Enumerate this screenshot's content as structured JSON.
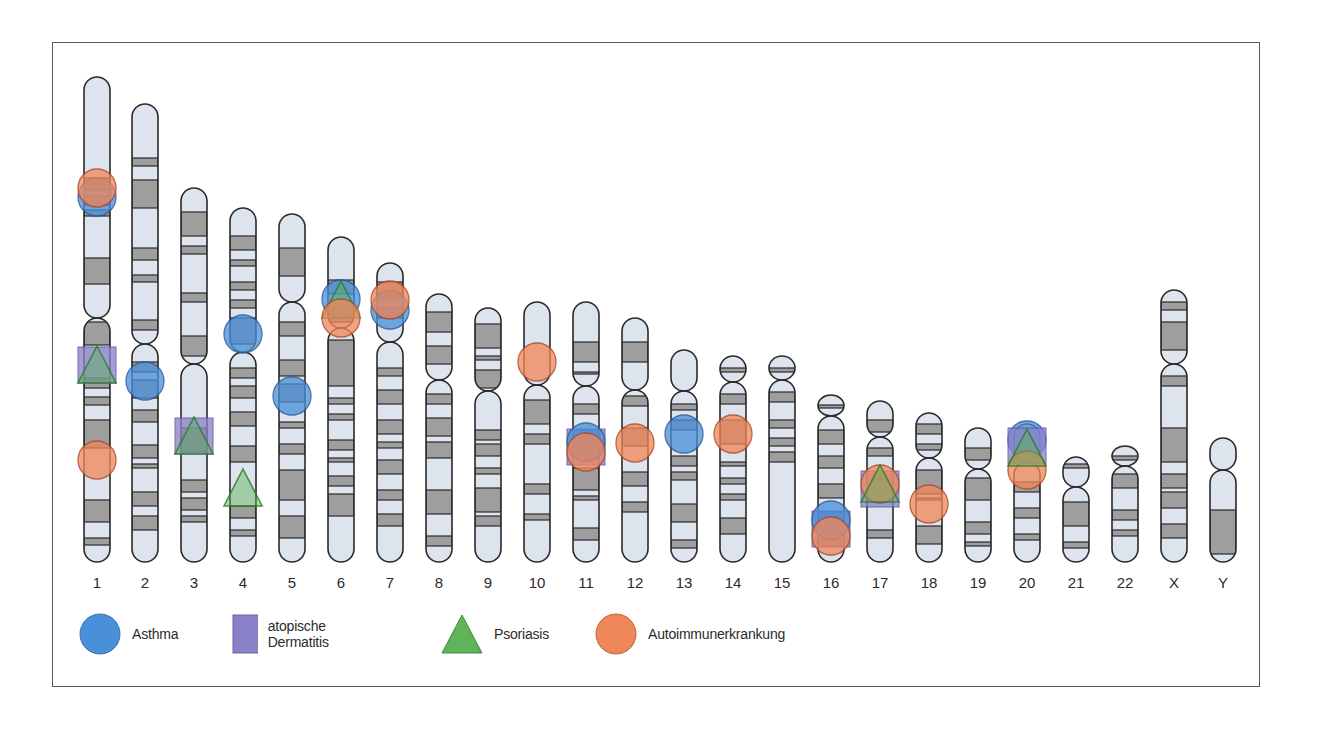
{
  "figure": {
    "colors": {
      "chromosome_fill": "#dde4ee",
      "band_fill": "#9e9e9e",
      "outline": "#2a2a2a",
      "asthma": "#4a90d9",
      "dermatitis": "#8a82c8",
      "psoriasis": "#5fb35a",
      "autoimmune": "#f0875a",
      "frame": "#5a5a5a"
    },
    "chromosomes": [
      {
        "label": "1",
        "x": 97,
        "top": 77,
        "cen": 318,
        "bottom": 562,
        "bands": [
          [
            178,
            190
          ],
          [
            196,
            205
          ],
          [
            210,
            216
          ],
          [
            258,
            284
          ],
          [
            322,
            345
          ],
          [
            378,
            388
          ],
          [
            397,
            405
          ],
          [
            420,
            448
          ],
          [
            500,
            522
          ],
          [
            538,
            545
          ]
        ]
      },
      {
        "label": "2",
        "x": 145,
        "top": 104,
        "cen": 344,
        "bottom": 562,
        "bands": [
          [
            158,
            166
          ],
          [
            180,
            208
          ],
          [
            248,
            260
          ],
          [
            275,
            282
          ],
          [
            320,
            330
          ],
          [
            362,
            372
          ],
          [
            380,
            398
          ],
          [
            410,
            422
          ],
          [
            445,
            458
          ],
          [
            464,
            468
          ],
          [
            492,
            506
          ],
          [
            516,
            530
          ]
        ]
      },
      {
        "label": "3",
        "x": 194,
        "top": 188,
        "cen": 364,
        "bottom": 562,
        "bands": [
          [
            212,
            236
          ],
          [
            246,
            254
          ],
          [
            293,
            302
          ],
          [
            336,
            356
          ],
          [
            428,
            452
          ],
          [
            480,
            492
          ],
          [
            498,
            510
          ],
          [
            516,
            522
          ]
        ]
      },
      {
        "label": "4",
        "x": 243,
        "top": 208,
        "cen": 352,
        "bottom": 562,
        "bands": [
          [
            236,
            250
          ],
          [
            260,
            266
          ],
          [
            282,
            290
          ],
          [
            300,
            308
          ],
          [
            318,
            344
          ],
          [
            368,
            378
          ],
          [
            386,
            398
          ],
          [
            412,
            426
          ],
          [
            446,
            462
          ],
          [
            506,
            518
          ],
          [
            530,
            536
          ]
        ]
      },
      {
        "label": "5",
        "x": 292,
        "top": 214,
        "cen": 302,
        "bottom": 562,
        "bands": [
          [
            248,
            276
          ],
          [
            322,
            336
          ],
          [
            360,
            376
          ],
          [
            384,
            402
          ],
          [
            422,
            428
          ],
          [
            444,
            454
          ],
          [
            470,
            500
          ],
          [
            516,
            538
          ]
        ]
      },
      {
        "label": "6",
        "x": 341,
        "top": 237,
        "cen": 328,
        "bottom": 562,
        "bands": [
          [
            280,
            294
          ],
          [
            308,
            322
          ],
          [
            340,
            386
          ],
          [
            398,
            404
          ],
          [
            414,
            420
          ],
          [
            440,
            450
          ],
          [
            458,
            462
          ],
          [
            476,
            486
          ],
          [
            494,
            516
          ]
        ]
      },
      {
        "label": "7",
        "x": 390,
        "top": 263,
        "cen": 342,
        "bottom": 562,
        "bands": [
          [
            282,
            298
          ],
          [
            308,
            318
          ],
          [
            368,
            376
          ],
          [
            390,
            404
          ],
          [
            420,
            434
          ],
          [
            442,
            448
          ],
          [
            460,
            474
          ],
          [
            490,
            500
          ],
          [
            514,
            526
          ]
        ]
      },
      {
        "label": "8",
        "x": 439,
        "top": 294,
        "cen": 380,
        "bottom": 562,
        "bands": [
          [
            312,
            332
          ],
          [
            346,
            364
          ],
          [
            394,
            404
          ],
          [
            418,
            436
          ],
          [
            442,
            458
          ],
          [
            490,
            514
          ],
          [
            536,
            546
          ]
        ]
      },
      {
        "label": "9",
        "x": 488,
        "top": 308,
        "cen": 391,
        "bottom": 562,
        "bands": [
          [
            324,
            348
          ],
          [
            356,
            360
          ],
          [
            370,
            388
          ],
          [
            430,
            440
          ],
          [
            444,
            456
          ],
          [
            468,
            474
          ],
          [
            488,
            512
          ],
          [
            516,
            526
          ]
        ]
      },
      {
        "label": "10",
        "x": 537,
        "top": 302,
        "cen": 385,
        "bottom": 562,
        "bands": [
          [
            400,
            424
          ],
          [
            434,
            444
          ],
          [
            484,
            494
          ],
          [
            514,
            520
          ]
        ]
      },
      {
        "label": "11",
        "x": 586,
        "top": 302,
        "cen": 386,
        "bottom": 562,
        "bands": [
          [
            342,
            362
          ],
          [
            372,
            374
          ],
          [
            404,
            414
          ],
          [
            430,
            446
          ],
          [
            468,
            490
          ],
          [
            496,
            500
          ],
          [
            528,
            540
          ]
        ]
      },
      {
        "label": "12",
        "x": 635,
        "top": 318,
        "cen": 390,
        "bottom": 562,
        "bands": [
          [
            342,
            362
          ],
          [
            396,
            406
          ],
          [
            428,
            446
          ],
          [
            472,
            486
          ],
          [
            502,
            512
          ]
        ]
      },
      {
        "label": "13",
        "x": 684,
        "top": 350,
        "cen": 391,
        "bottom": 562,
        "bands": [
          [
            404,
            410
          ],
          [
            420,
            430
          ],
          [
            456,
            466
          ],
          [
            472,
            480
          ],
          [
            504,
            522
          ],
          [
            540,
            548
          ]
        ]
      },
      {
        "label": "14",
        "x": 733,
        "top": 356,
        "cen": 382,
        "bottom": 562,
        "bands": [
          [
            368,
            372
          ],
          [
            394,
            404
          ],
          [
            420,
            444
          ],
          [
            462,
            466
          ],
          [
            478,
            484
          ],
          [
            494,
            500
          ],
          [
            518,
            534
          ]
        ]
      },
      {
        "label": "15",
        "x": 782,
        "top": 356,
        "cen": 380,
        "bottom": 562,
        "bands": [
          [
            368,
            372
          ],
          [
            392,
            402
          ],
          [
            420,
            428
          ],
          [
            438,
            446
          ],
          [
            452,
            462
          ]
        ]
      },
      {
        "label": "16",
        "x": 831,
        "top": 395,
        "cen": 416,
        "bottom": 562,
        "bands": [
          [
            405,
            408
          ],
          [
            430,
            444
          ],
          [
            456,
            468
          ],
          [
            484,
            498
          ],
          [
            512,
            518
          ],
          [
            528,
            532
          ],
          [
            540,
            546
          ]
        ]
      },
      {
        "label": "17",
        "x": 880,
        "top": 401,
        "cen": 437,
        "bottom": 562,
        "bands": [
          [
            420,
            432
          ],
          [
            448,
            456
          ],
          [
            530,
            538
          ]
        ]
      },
      {
        "label": "18",
        "x": 929,
        "top": 413,
        "cen": 458,
        "bottom": 562,
        "bands": [
          [
            424,
            434
          ],
          [
            444,
            450
          ],
          [
            470,
            494
          ],
          [
            498,
            500
          ],
          [
            526,
            544
          ]
        ]
      },
      {
        "label": "19",
        "x": 978,
        "top": 428,
        "cen": 469,
        "bottom": 562,
        "bands": [
          [
            448,
            460
          ],
          [
            478,
            500
          ],
          [
            522,
            534
          ],
          [
            542,
            546
          ]
        ]
      },
      {
        "label": "20",
        "x": 1027,
        "top": 424,
        "cen": 462,
        "bottom": 562,
        "bands": [
          [
            482,
            492
          ],
          [
            508,
            518
          ],
          [
            534,
            540
          ]
        ]
      },
      {
        "label": "21",
        "x": 1076,
        "top": 457,
        "cen": 487,
        "bottom": 562,
        "bands": [
          [
            464,
            468
          ],
          [
            502,
            526
          ],
          [
            542,
            548
          ]
        ]
      },
      {
        "label": "22",
        "x": 1125,
        "top": 446,
        "cen": 466,
        "bottom": 562,
        "bands": [
          [
            456,
            460
          ],
          [
            474,
            488
          ],
          [
            510,
            520
          ],
          [
            530,
            536
          ]
        ]
      },
      {
        "label": "X",
        "x": 1174,
        "top": 290,
        "cen": 364,
        "bottom": 562,
        "bands": [
          [
            302,
            310
          ],
          [
            322,
            350
          ],
          [
            376,
            386
          ],
          [
            428,
            462
          ],
          [
            474,
            488
          ],
          [
            492,
            508
          ],
          [
            524,
            538
          ]
        ]
      },
      {
        "label": "Y",
        "x": 1223,
        "top": 438,
        "cen": 470,
        "bottom": 562,
        "bands": [
          [
            510,
            554
          ]
        ]
      }
    ],
    "markers": [
      {
        "chr": 0,
        "type": "asthma",
        "y": 197
      },
      {
        "chr": 0,
        "type": "autoimmune",
        "y": 188
      },
      {
        "chr": 0,
        "type": "dermatitis",
        "y": 365
      },
      {
        "chr": 0,
        "type": "psoriasis",
        "y": 365
      },
      {
        "chr": 0,
        "type": "autoimmune",
        "y": 460
      },
      {
        "chr": 1,
        "type": "asthma",
        "y": 381
      },
      {
        "chr": 2,
        "type": "dermatitis",
        "y": 436
      },
      {
        "chr": 2,
        "type": "psoriasis",
        "y": 436
      },
      {
        "chr": 3,
        "type": "asthma",
        "y": 334
      },
      {
        "chr": 3,
        "type": "psoriasis",
        "y": 488
      },
      {
        "chr": 4,
        "type": "asthma",
        "y": 396
      },
      {
        "chr": 5,
        "type": "asthma",
        "y": 299
      },
      {
        "chr": 5,
        "type": "psoriasis",
        "y": 300
      },
      {
        "chr": 5,
        "type": "autoimmune",
        "y": 318
      },
      {
        "chr": 6,
        "type": "asthma",
        "y": 310
      },
      {
        "chr": 6,
        "type": "autoimmune",
        "y": 300
      },
      {
        "chr": 9,
        "type": "autoimmune",
        "y": 362
      },
      {
        "chr": 10,
        "type": "dermatitis",
        "y": 447
      },
      {
        "chr": 10,
        "type": "asthma",
        "y": 442
      },
      {
        "chr": 10,
        "type": "autoimmune",
        "y": 452
      },
      {
        "chr": 11,
        "type": "autoimmune",
        "y": 443
      },
      {
        "chr": 12,
        "type": "asthma",
        "y": 434
      },
      {
        "chr": 13,
        "type": "autoimmune",
        "y": 434
      },
      {
        "chr": 15,
        "type": "dermatitis",
        "y": 529
      },
      {
        "chr": 15,
        "type": "asthma",
        "y": 520
      },
      {
        "chr": 15,
        "type": "autoimmune",
        "y": 536
      },
      {
        "chr": 16,
        "type": "dermatitis",
        "y": 489
      },
      {
        "chr": 16,
        "type": "autoimmune",
        "y": 484
      },
      {
        "chr": 16,
        "type": "psoriasis",
        "y": 484
      },
      {
        "chr": 17,
        "type": "autoimmune",
        "y": 504
      },
      {
        "chr": 19,
        "type": "asthma",
        "y": 440
      },
      {
        "chr": 19,
        "type": "dermatitis",
        "y": 446
      },
      {
        "chr": 19,
        "type": "autoimmune",
        "y": 470
      },
      {
        "chr": 19,
        "type": "psoriasis",
        "y": 448
      }
    ]
  },
  "legend": {
    "items": [
      {
        "type": "asthma",
        "label": "Asthma"
      },
      {
        "type": "dermatitis",
        "label": "atopische Dermatitis"
      },
      {
        "type": "psoriasis",
        "label": "Psoriasis"
      },
      {
        "type": "autoimmune",
        "label": "Autoimmunerkrankung"
      }
    ]
  }
}
